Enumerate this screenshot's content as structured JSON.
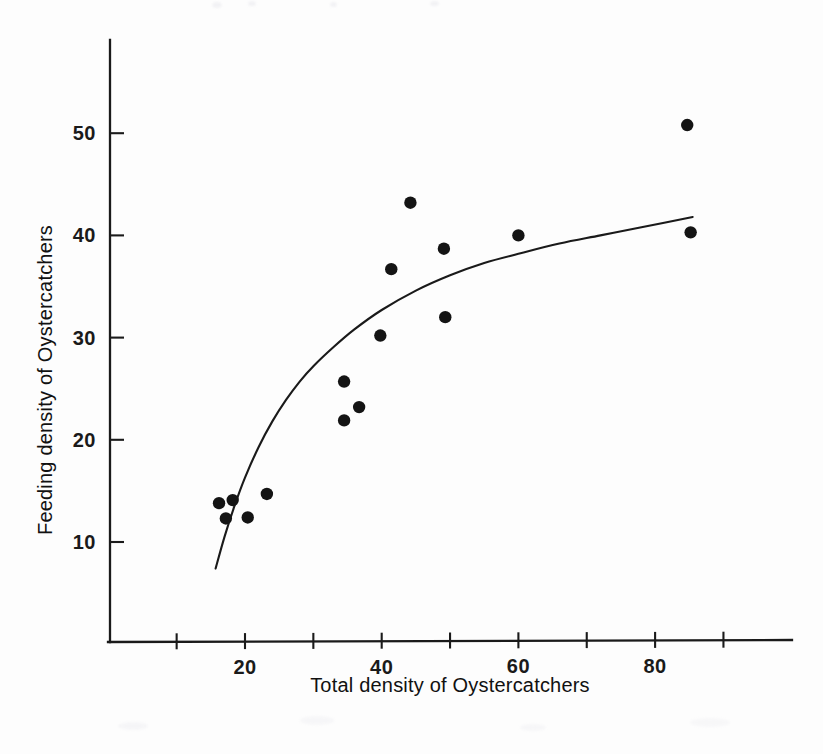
{
  "figure": {
    "background_color": "#fdfdfd",
    "ink_color": "#1a1a1a"
  },
  "axes": {
    "x_title": "Total density of Oystercatchers",
    "y_title": "Feeding density of Oystercatchers",
    "x_tick_labels": [
      "20",
      "40",
      "60",
      "80"
    ],
    "y_tick_labels": [
      "10",
      "20",
      "30",
      "40",
      "50"
    ]
  },
  "chart_data": {
    "type": "scatter",
    "title": "",
    "xlabel": "Total density of Oystercatchers",
    "ylabel": "Feeding density of Oystercatchers",
    "xlim": [
      8,
      96
    ],
    "ylim": [
      0,
      58
    ],
    "grid": false,
    "legend": null,
    "x_ticks": [
      10,
      20,
      30,
      40,
      50,
      60,
      70,
      80,
      90
    ],
    "x_ticks_labeled": [
      20,
      40,
      60,
      80
    ],
    "y_ticks": [
      10,
      20,
      30,
      40,
      50
    ],
    "y_ticks_labeled": [
      10,
      20,
      30,
      40,
      50
    ],
    "marker": "filled-circle",
    "marker_color": "#141414",
    "points": [
      {
        "x": 16.2,
        "y": 13.8
      },
      {
        "x": 17.2,
        "y": 12.3
      },
      {
        "x": 18.2,
        "y": 14.1
      },
      {
        "x": 20.4,
        "y": 12.4
      },
      {
        "x": 23.2,
        "y": 14.7
      },
      {
        "x": 34.5,
        "y": 25.7
      },
      {
        "x": 34.5,
        "y": 21.9
      },
      {
        "x": 36.7,
        "y": 23.2
      },
      {
        "x": 39.8,
        "y": 30.2
      },
      {
        "x": 41.4,
        "y": 36.7
      },
      {
        "x": 44.2,
        "y": 43.2
      },
      {
        "x": 49.1,
        "y": 38.7
      },
      {
        "x": 49.3,
        "y": 32.0
      },
      {
        "x": 60.0,
        "y": 40.0
      },
      {
        "x": 84.7,
        "y": 50.8
      },
      {
        "x": 85.2,
        "y": 40.3
      }
    ],
    "fit_curve": {
      "description": "smooth increasing saturating curve",
      "points": [
        {
          "x": 15.7,
          "y": 7.4
        },
        {
          "x": 17.0,
          "y": 10.5
        },
        {
          "x": 18.5,
          "y": 13.6
        },
        {
          "x": 20.0,
          "y": 16.3
        },
        {
          "x": 22.0,
          "y": 19.3
        },
        {
          "x": 24.0,
          "y": 21.8
        },
        {
          "x": 26.0,
          "y": 23.9
        },
        {
          "x": 28.0,
          "y": 25.7
        },
        {
          "x": 30.0,
          "y": 27.2
        },
        {
          "x": 33.0,
          "y": 29.1
        },
        {
          "x": 36.0,
          "y": 30.8
        },
        {
          "x": 40.0,
          "y": 32.7
        },
        {
          "x": 45.0,
          "y": 34.6
        },
        {
          "x": 50.0,
          "y": 36.1
        },
        {
          "x": 55.0,
          "y": 37.3
        },
        {
          "x": 60.0,
          "y": 38.2
        },
        {
          "x": 66.0,
          "y": 39.2
        },
        {
          "x": 72.0,
          "y": 40.0
        },
        {
          "x": 78.0,
          "y": 40.8
        },
        {
          "x": 85.5,
          "y": 41.8
        }
      ]
    }
  }
}
